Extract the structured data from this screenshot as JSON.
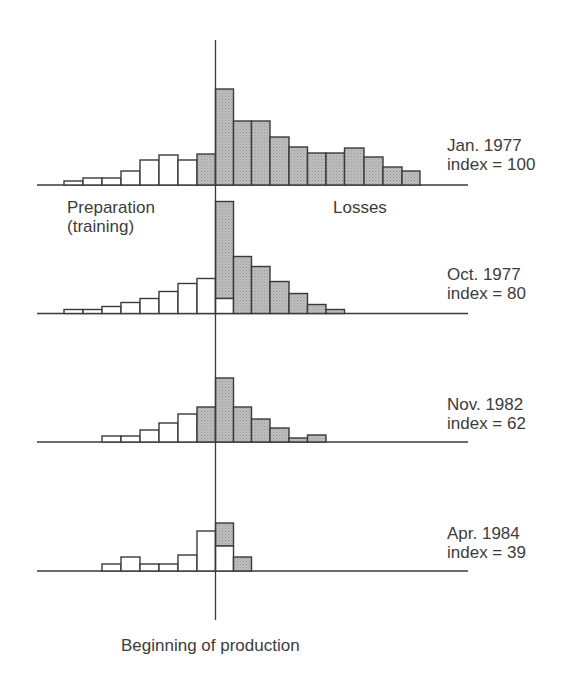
{
  "chart_data": {
    "type": "bar",
    "title": "",
    "xlabel": "Beginning of production",
    "ylabel": "",
    "grid": false,
    "legend": null,
    "annotations": {
      "left_region": "Preparation (training)",
      "right_region": "Losses",
      "center_marker": "Beginning of production"
    },
    "bar_slots": 19,
    "production_start_slot": 8,
    "panels": [
      {
        "date": "Jan. 1977",
        "index_label": "index = 100",
        "index": 100,
        "bars": [
          {
            "slot": 0,
            "preparation": 4,
            "losses": 0
          },
          {
            "slot": 1,
            "preparation": 7,
            "losses": 0
          },
          {
            "slot": 2,
            "preparation": 7,
            "losses": 0
          },
          {
            "slot": 3,
            "preparation": 14,
            "losses": 0
          },
          {
            "slot": 4,
            "preparation": 25,
            "losses": 0
          },
          {
            "slot": 5,
            "preparation": 30,
            "losses": 0
          },
          {
            "slot": 6,
            "preparation": 25,
            "losses": 0
          },
          {
            "slot": 7,
            "preparation": 0,
            "losses": 31
          },
          {
            "slot": 8,
            "preparation": 0,
            "losses": 96
          },
          {
            "slot": 9,
            "preparation": 0,
            "losses": 64
          },
          {
            "slot": 10,
            "preparation": 0,
            "losses": 64
          },
          {
            "slot": 11,
            "preparation": 0,
            "losses": 48
          },
          {
            "slot": 12,
            "preparation": 0,
            "losses": 38
          },
          {
            "slot": 13,
            "preparation": 0,
            "losses": 32
          },
          {
            "slot": 14,
            "preparation": 0,
            "losses": 32
          },
          {
            "slot": 15,
            "preparation": 0,
            "losses": 37
          },
          {
            "slot": 16,
            "preparation": 0,
            "losses": 28
          },
          {
            "slot": 17,
            "preparation": 0,
            "losses": 18
          },
          {
            "slot": 18,
            "preparation": 0,
            "losses": 14
          }
        ]
      },
      {
        "date": "Oct. 1977",
        "index_label": "index = 80",
        "index": 80,
        "bars": [
          {
            "slot": 0,
            "preparation": 4,
            "losses": 0
          },
          {
            "slot": 1,
            "preparation": 4,
            "losses": 0
          },
          {
            "slot": 2,
            "preparation": 7,
            "losses": 0
          },
          {
            "slot": 3,
            "preparation": 11,
            "losses": 0
          },
          {
            "slot": 4,
            "preparation": 15,
            "losses": 0
          },
          {
            "slot": 5,
            "preparation": 22,
            "losses": 0
          },
          {
            "slot": 6,
            "preparation": 30,
            "losses": 0
          },
          {
            "slot": 7,
            "preparation": 35,
            "losses": 0
          },
          {
            "slot": 8,
            "preparation": 15,
            "losses": 97
          },
          {
            "slot": 9,
            "preparation": 0,
            "losses": 57
          },
          {
            "slot": 10,
            "preparation": 0,
            "losses": 47
          },
          {
            "slot": 11,
            "preparation": 0,
            "losses": 32
          },
          {
            "slot": 12,
            "preparation": 0,
            "losses": 20
          },
          {
            "slot": 13,
            "preparation": 0,
            "losses": 9
          },
          {
            "slot": 14,
            "preparation": 0,
            "losses": 4
          }
        ]
      },
      {
        "date": "Nov. 1982",
        "index_label": "index = 62",
        "index": 62,
        "bars": [
          {
            "slot": 2,
            "preparation": 6,
            "losses": 0
          },
          {
            "slot": 3,
            "preparation": 6,
            "losses": 0
          },
          {
            "slot": 4,
            "preparation": 12,
            "losses": 0
          },
          {
            "slot": 5,
            "preparation": 19,
            "losses": 0
          },
          {
            "slot": 6,
            "preparation": 28,
            "losses": 0
          },
          {
            "slot": 7,
            "preparation": 0,
            "losses": 35
          },
          {
            "slot": 8,
            "preparation": 0,
            "losses": 64
          },
          {
            "slot": 9,
            "preparation": 0,
            "losses": 35
          },
          {
            "slot": 10,
            "preparation": 0,
            "losses": 23
          },
          {
            "slot": 11,
            "preparation": 0,
            "losses": 14
          },
          {
            "slot": 12,
            "preparation": 0,
            "losses": 4
          },
          {
            "slot": 13,
            "preparation": 0,
            "losses": 7
          }
        ]
      },
      {
        "date": "Apr. 1984",
        "index_label": "index = 39",
        "index": 39,
        "bars": [
          {
            "slot": 2,
            "preparation": 7,
            "losses": 0
          },
          {
            "slot": 3,
            "preparation": 14,
            "losses": 0
          },
          {
            "slot": 4,
            "preparation": 7,
            "losses": 0
          },
          {
            "slot": 5,
            "preparation": 7,
            "losses": 0
          },
          {
            "slot": 6,
            "preparation": 16,
            "losses": 0
          },
          {
            "slot": 7,
            "preparation": 40,
            "losses": 0
          },
          {
            "slot": 8,
            "preparation": 25,
            "losses": 23
          },
          {
            "slot": 9,
            "preparation": 0,
            "losses": 14
          }
        ]
      }
    ]
  },
  "labels": {
    "preparation_line1": "Preparation",
    "preparation_line2": "(training)",
    "losses": "Losses",
    "beginning": "Beginning of production"
  },
  "colors": {
    "losses_fill": "#b4b4b4",
    "preparation_fill": "#ffffff",
    "stroke": "#3a3a3a"
  }
}
